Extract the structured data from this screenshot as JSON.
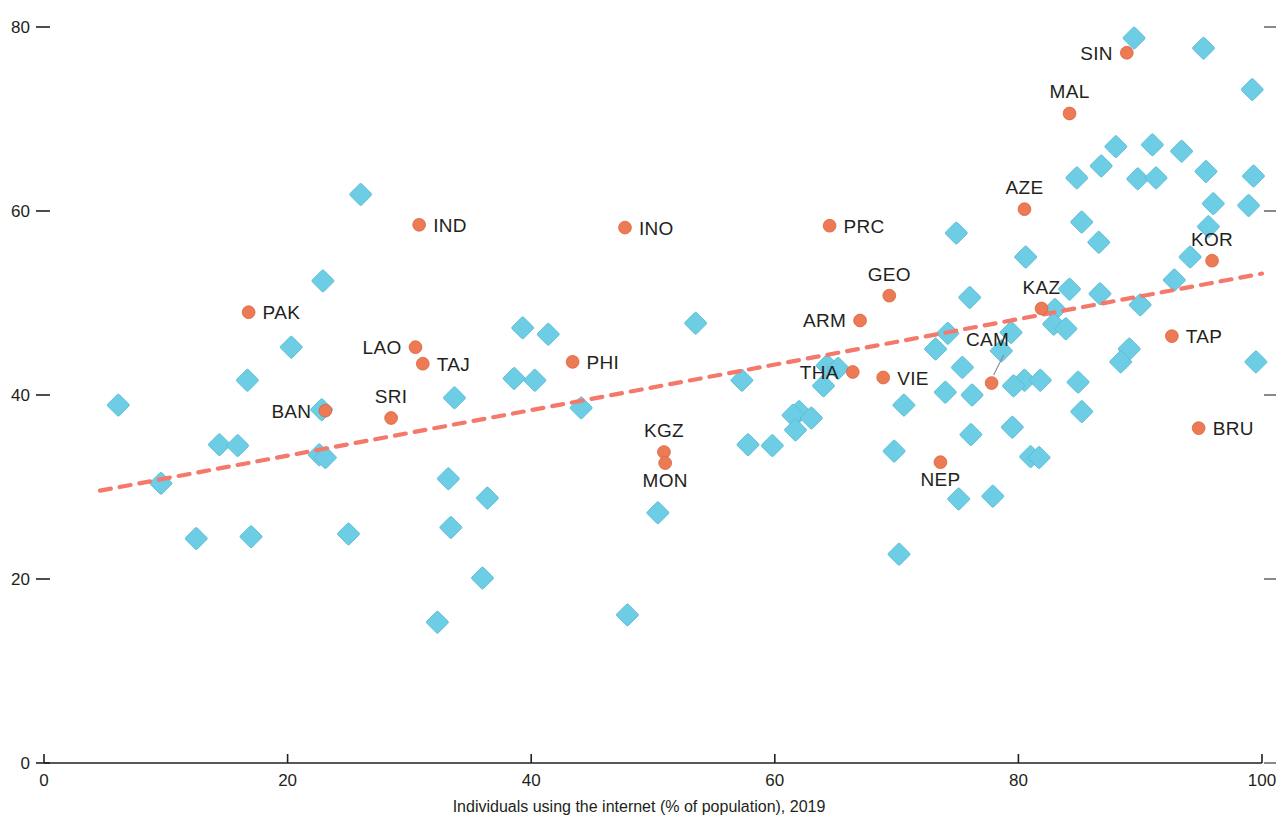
{
  "chart_data": {
    "type": "scatter",
    "title": "",
    "xlabel": "Individuals using the internet (% of population), 2019",
    "ylabel": "",
    "xlim": [
      0,
      100
    ],
    "ylim": [
      0,
      80
    ],
    "xticks": [
      "0",
      "20",
      "40",
      "60",
      "80",
      "100"
    ],
    "xtick_values": [
      0,
      20,
      40,
      60,
      80,
      100
    ],
    "yticks": [
      "0",
      "20",
      "40",
      "60",
      "80"
    ],
    "ytick_values": [
      0,
      20,
      40,
      60,
      80
    ],
    "grid": false,
    "legend": "none",
    "trendline": {
      "type": "linear-dashed",
      "color": "#f4796b",
      "x_start": 4.6,
      "y_start": 29.6,
      "x_end": 100.0,
      "y_end": 53.2
    },
    "series": [
      {
        "name": "labeled-economies",
        "marker": "circle",
        "color": "#ec7a55",
        "points": [
          {
            "label": "SIN",
            "x": 88.9,
            "y": 77.2,
            "label_pos": "left"
          },
          {
            "label": "MAL",
            "x": 84.2,
            "y": 70.6,
            "label_pos": "above"
          },
          {
            "label": "AZE",
            "x": 80.5,
            "y": 60.2,
            "label_pos": "above"
          },
          {
            "label": "PRC",
            "x": 64.5,
            "y": 58.4,
            "label_pos": "right"
          },
          {
            "label": "IND",
            "x": 30.8,
            "y": 58.5,
            "label_pos": "right"
          },
          {
            "label": "INO",
            "x": 47.7,
            "y": 58.2,
            "label_pos": "right"
          },
          {
            "label": "KOR",
            "x": 95.9,
            "y": 54.6,
            "label_pos": "above"
          },
          {
            "label": "GEO",
            "x": 69.4,
            "y": 50.8,
            "label_pos": "above"
          },
          {
            "label": "PAK",
            "x": 16.8,
            "y": 49.0,
            "label_pos": "right"
          },
          {
            "label": "KAZ",
            "x": 81.9,
            "y": 49.4,
            "label_pos": "above"
          },
          {
            "label": "ARM",
            "x": 67.0,
            "y": 48.1,
            "label_pos": "left"
          },
          {
            "label": "TAP",
            "x": 92.6,
            "y": 46.4,
            "label_pos": "right"
          },
          {
            "label": "LAO",
            "x": 30.5,
            "y": 45.2,
            "label_pos": "left"
          },
          {
            "label": "TAJ",
            "x": 31.1,
            "y": 43.4,
            "label_pos": "right"
          },
          {
            "label": "PHI",
            "x": 43.4,
            "y": 43.6,
            "label_pos": "right"
          },
          {
            "label": "THA",
            "x": 66.4,
            "y": 42.5,
            "label_pos": "left"
          },
          {
            "label": "VIE",
            "x": 68.9,
            "y": 41.9,
            "label_pos": "right"
          },
          {
            "label": "CAM",
            "x": 77.8,
            "y": 41.3,
            "label_pos": "leader"
          },
          {
            "label": "BAN",
            "x": 23.1,
            "y": 38.3,
            "label_pos": "left"
          },
          {
            "label": "SRI",
            "x": 28.5,
            "y": 37.5,
            "label_pos": "above"
          },
          {
            "label": "BRU",
            "x": 94.8,
            "y": 36.4,
            "label_pos": "right"
          },
          {
            "label": "KGZ",
            "x": 50.9,
            "y": 33.8,
            "label_pos": "above"
          },
          {
            "label": "MON",
            "x": 51.0,
            "y": 32.6,
            "label_pos": "below"
          },
          {
            "label": "NEP",
            "x": 73.6,
            "y": 32.7,
            "label_pos": "below"
          }
        ]
      },
      {
        "name": "other-economies",
        "marker": "diamond",
        "color": "#6ccde4",
        "points": [
          {
            "x": 89.5,
            "y": 78.8
          },
          {
            "x": 95.2,
            "y": 77.7
          },
          {
            "x": 99.2,
            "y": 73.2
          },
          {
            "x": 88.0,
            "y": 67.0
          },
          {
            "x": 91.0,
            "y": 67.2
          },
          {
            "x": 93.4,
            "y": 66.5
          },
          {
            "x": 86.8,
            "y": 64.9
          },
          {
            "x": 89.8,
            "y": 63.5
          },
          {
            "x": 91.3,
            "y": 63.6
          },
          {
            "x": 95.4,
            "y": 64.3
          },
          {
            "x": 99.3,
            "y": 63.8
          },
          {
            "x": 84.8,
            "y": 63.6
          },
          {
            "x": 96.0,
            "y": 60.8
          },
          {
            "x": 98.9,
            "y": 60.6
          },
          {
            "x": 95.6,
            "y": 58.3
          },
          {
            "x": 26.0,
            "y": 61.8
          },
          {
            "x": 74.9,
            "y": 57.6
          },
          {
            "x": 85.2,
            "y": 58.8
          },
          {
            "x": 80.6,
            "y": 55.0
          },
          {
            "x": 86.6,
            "y": 56.6
          },
          {
            "x": 22.9,
            "y": 52.4
          },
          {
            "x": 76.0,
            "y": 50.6
          },
          {
            "x": 84.2,
            "y": 51.5
          },
          {
            "x": 86.7,
            "y": 51.0
          },
          {
            "x": 83.0,
            "y": 49.3
          },
          {
            "x": 82.9,
            "y": 47.7
          },
          {
            "x": 83.9,
            "y": 47.2
          },
          {
            "x": 53.5,
            "y": 47.8
          },
          {
            "x": 39.3,
            "y": 47.3
          },
          {
            "x": 41.4,
            "y": 46.6
          },
          {
            "x": 89.1,
            "y": 45.0
          },
          {
            "x": 20.3,
            "y": 45.2
          },
          {
            "x": 88.4,
            "y": 43.6
          },
          {
            "x": 16.7,
            "y": 41.6
          },
          {
            "x": 75.4,
            "y": 43.0
          },
          {
            "x": 38.6,
            "y": 41.8
          },
          {
            "x": 40.3,
            "y": 41.6
          },
          {
            "x": 57.3,
            "y": 41.6
          },
          {
            "x": 64.3,
            "y": 43.2
          },
          {
            "x": 65.2,
            "y": 42.9
          },
          {
            "x": 64.0,
            "y": 41.0
          },
          {
            "x": 80.5,
            "y": 41.6
          },
          {
            "x": 81.8,
            "y": 41.6
          },
          {
            "x": 79.6,
            "y": 41.0
          },
          {
            "x": 84.9,
            "y": 41.4
          },
          {
            "x": 74.0,
            "y": 40.3
          },
          {
            "x": 76.2,
            "y": 40.0
          },
          {
            "x": 6.1,
            "y": 38.9
          },
          {
            "x": 33.7,
            "y": 39.7
          },
          {
            "x": 22.8,
            "y": 38.4
          },
          {
            "x": 44.1,
            "y": 38.6
          },
          {
            "x": 62.0,
            "y": 38.2
          },
          {
            "x": 61.5,
            "y": 37.8
          },
          {
            "x": 63.0,
            "y": 37.5
          },
          {
            "x": 70.6,
            "y": 38.9
          },
          {
            "x": 85.2,
            "y": 38.2
          },
          {
            "x": 61.7,
            "y": 36.2
          },
          {
            "x": 76.1,
            "y": 35.7
          },
          {
            "x": 79.5,
            "y": 36.5
          },
          {
            "x": 14.4,
            "y": 34.6
          },
          {
            "x": 15.9,
            "y": 34.5
          },
          {
            "x": 22.6,
            "y": 33.5
          },
          {
            "x": 23.1,
            "y": 33.2
          },
          {
            "x": 57.8,
            "y": 34.6
          },
          {
            "x": 59.8,
            "y": 34.5
          },
          {
            "x": 69.8,
            "y": 33.9
          },
          {
            "x": 81.0,
            "y": 33.3
          },
          {
            "x": 81.7,
            "y": 33.2
          },
          {
            "x": 33.2,
            "y": 30.9
          },
          {
            "x": 36.4,
            "y": 28.8
          },
          {
            "x": 77.9,
            "y": 29.0
          },
          {
            "x": 75.1,
            "y": 28.7
          },
          {
            "x": 50.4,
            "y": 27.2
          },
          {
            "x": 12.5,
            "y": 24.4
          },
          {
            "x": 17.0,
            "y": 24.6
          },
          {
            "x": 25.0,
            "y": 24.9
          },
          {
            "x": 33.4,
            "y": 25.6
          },
          {
            "x": 70.2,
            "y": 22.7
          },
          {
            "x": 36.0,
            "y": 20.1
          },
          {
            "x": 32.3,
            "y": 15.3
          },
          {
            "x": 47.9,
            "y": 16.1
          },
          {
            "x": 9.6,
            "y": 30.4
          },
          {
            "x": 78.6,
            "y": 44.8
          },
          {
            "x": 73.2,
            "y": 45.0
          },
          {
            "x": 74.2,
            "y": 46.7
          },
          {
            "x": 79.4,
            "y": 46.8
          },
          {
            "x": 90.0,
            "y": 49.8
          },
          {
            "x": 92.8,
            "y": 52.5
          },
          {
            "x": 94.1,
            "y": 55.0
          },
          {
            "x": 99.5,
            "y": 43.6
          }
        ]
      }
    ]
  },
  "axes": {
    "x_title": "Individuals using the internet (% of population), 2019"
  },
  "top_clipped_note": ""
}
